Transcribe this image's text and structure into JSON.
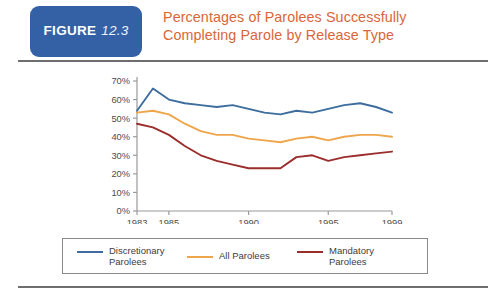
{
  "header": {
    "badge_word": "FIGURE",
    "badge_number": "12.3",
    "badge_color": "#3461a6",
    "title_line1": "Percentages of Parolees Successfully",
    "title_line2": "Completing Parole by Release Type",
    "title_color": "#d9663a"
  },
  "legend": {
    "items": [
      {
        "label": "Discretionary\nParolees",
        "color": "#3d6d9e"
      },
      {
        "label": "All Parolees",
        "color": "#efa54a"
      },
      {
        "label": "Mandatory\nParolees",
        "color": "#9b2d2d"
      }
    ]
  },
  "chart_data": {
    "type": "line",
    "title": "Percentages of Parolees Successfully Completing Parole by Release Type",
    "xlabel": "",
    "ylabel": "",
    "xlim": [
      1983,
      1999
    ],
    "ylim": [
      0,
      70
    ],
    "grid": false,
    "legend_position": "bottom",
    "x": [
      1983,
      1984,
      1985,
      1986,
      1987,
      1988,
      1989,
      1990,
      1991,
      1992,
      1993,
      1994,
      1995,
      1996,
      1997,
      1998,
      1999
    ],
    "xtick_labels": [
      "1983",
      "1985",
      "1990",
      "1995",
      "1999"
    ],
    "xtick_values": [
      1983,
      1985,
      1990,
      1995,
      1999
    ],
    "ytick_labels": [
      "0%",
      "10%",
      "20%",
      "30%",
      "40%",
      "50%",
      "60%",
      "70%"
    ],
    "ytick_values": [
      0,
      10,
      20,
      30,
      40,
      50,
      60,
      70
    ],
    "series": [
      {
        "name": "Discretionary Parolees",
        "color": "#3d6d9e",
        "values": [
          54,
          66,
          60,
          58,
          57,
          56,
          57,
          55,
          53,
          52,
          54,
          53,
          55,
          57,
          58,
          56,
          53
        ]
      },
      {
        "name": "All Parolees",
        "color": "#efa54a",
        "values": [
          53,
          54,
          52,
          47,
          43,
          41,
          41,
          39,
          38,
          37,
          39,
          40,
          38,
          40,
          41,
          41,
          40
        ]
      },
      {
        "name": "Mandatory Parolees",
        "color": "#9b2d2d",
        "values": [
          47,
          45,
          41,
          35,
          30,
          27,
          25,
          23,
          23,
          23,
          29,
          30,
          27,
          29,
          30,
          31,
          32
        ]
      }
    ]
  }
}
